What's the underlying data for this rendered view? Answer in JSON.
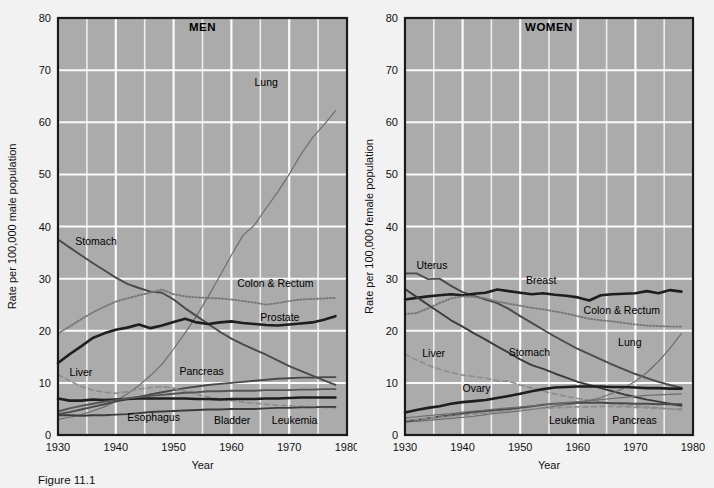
{
  "figure": {
    "background_color": "#f2f2f2",
    "plot_background_color": "#ababab",
    "gridline_color": "#ffffff",
    "frame_color": "#1a1a1a",
    "caption": "Figure 11.1"
  },
  "panels": [
    {
      "key": "men",
      "title": "MEN",
      "xlabel": "Year",
      "ylabel": "Rate per 100,000 male population"
    },
    {
      "key": "women",
      "title": "WOMEN",
      "xlabel": "Year",
      "ylabel": "Rate per 100,000 female population"
    }
  ],
  "chart_data": [
    {
      "type": "line",
      "title": "MEN",
      "xlabel": "Year",
      "ylabel": "Rate per 100,000 male population",
      "xlim": [
        1930,
        1980
      ],
      "ylim": [
        0,
        80
      ],
      "xticks": [
        1930,
        1940,
        1950,
        1960,
        1970,
        1980
      ],
      "yticks": [
        0,
        10,
        20,
        30,
        40,
        50,
        60,
        70,
        80
      ],
      "grid": true,
      "minor_grid_x_every": 5,
      "legend": "inline-annotations",
      "x": [
        1930,
        1932,
        1934,
        1936,
        1938,
        1940,
        1942,
        1944,
        1946,
        1948,
        1950,
        1952,
        1954,
        1956,
        1958,
        1960,
        1962,
        1964,
        1966,
        1968,
        1970,
        1972,
        1974,
        1976,
        1978
      ],
      "series": [
        {
          "name": "Lung",
          "style": "thin-solid",
          "color": "#6e6e6e",
          "values": [
            3.0,
            3.4,
            3.9,
            4.6,
            5.4,
            6.5,
            7.9,
            9.5,
            11.4,
            13.6,
            16.5,
            19.6,
            22.9,
            26.6,
            30.5,
            34.5,
            38.3,
            40.3,
            43.5,
            46.6,
            50.0,
            53.8,
            57.0,
            59.5,
            62.2
          ]
        },
        {
          "name": "Stomach",
          "style": "medium-solid",
          "color": "#4a4a4a",
          "values": [
            37.5,
            36.0,
            34.5,
            33.0,
            31.6,
            30.2,
            29.0,
            28.2,
            27.5,
            27.3,
            26.0,
            24.3,
            22.8,
            21.3,
            19.8,
            18.5,
            17.4,
            16.4,
            15.4,
            14.3,
            13.2,
            12.3,
            11.4,
            10.5,
            9.6
          ]
        },
        {
          "name": "Colon & Rectum",
          "style": "dotted",
          "color": "#777777",
          "values": [
            19.5,
            20.8,
            22.2,
            23.5,
            24.6,
            25.6,
            26.2,
            26.8,
            27.3,
            27.9,
            27.0,
            26.6,
            26.4,
            26.3,
            26.2,
            26.0,
            25.7,
            25.4,
            25.0,
            25.3,
            25.7,
            26.0,
            26.1,
            26.2,
            26.3
          ]
        },
        {
          "name": "Prostate",
          "style": "thick-solid",
          "color": "#1e1e1e",
          "values": [
            13.8,
            15.5,
            17.0,
            18.6,
            19.5,
            20.2,
            20.6,
            21.2,
            20.5,
            21.0,
            21.7,
            22.3,
            21.6,
            21.3,
            21.6,
            21.8,
            21.5,
            21.3,
            21.1,
            21.0,
            21.2,
            21.4,
            21.6,
            22.1,
            22.8
          ]
        },
        {
          "name": "Pancreas",
          "style": "medium-solid",
          "color": "#4a4a4a",
          "values": [
            4.0,
            4.4,
            4.9,
            5.4,
            5.9,
            6.4,
            6.9,
            7.3,
            7.8,
            8.2,
            8.6,
            9.0,
            9.3,
            9.6,
            9.8,
            10.0,
            10.2,
            10.4,
            10.6,
            10.8,
            10.9,
            11.0,
            11.0,
            11.1,
            11.1
          ]
        },
        {
          "name": "Liver",
          "style": "dashed",
          "color": "#8e8e8e",
          "values": [
            11.6,
            10.4,
            9.3,
            8.6,
            8.2,
            8.0,
            8.3,
            8.8,
            9.1,
            9.3,
            9.0,
            8.4,
            7.8,
            7.3,
            6.9,
            6.6,
            6.3,
            6.1,
            5.9,
            5.7,
            5.6,
            5.5,
            5.4,
            5.3,
            5.2
          ]
        },
        {
          "name": "Esophagus",
          "style": "medium-solid",
          "color": "#3c3c3c",
          "values": [
            3.8,
            3.8,
            3.7,
            3.8,
            3.8,
            3.9,
            4.0,
            4.2,
            4.4,
            4.5,
            4.6,
            4.7,
            4.8,
            4.9,
            4.9,
            5.0,
            5.0,
            5.0,
            5.1,
            5.2,
            5.2,
            5.3,
            5.3,
            5.4,
            5.4
          ]
        },
        {
          "name": "Bladder",
          "style": "thick-solid",
          "color": "#1e1e1e",
          "values": [
            7.0,
            6.6,
            6.6,
            6.8,
            6.7,
            6.8,
            6.9,
            7.0,
            7.0,
            7.0,
            7.0,
            7.0,
            6.9,
            6.9,
            6.8,
            6.9,
            6.9,
            6.9,
            7.0,
            7.0,
            7.1,
            7.2,
            7.2,
            7.2,
            7.2
          ]
        },
        {
          "name": "Leukemia",
          "style": "medium-solid",
          "color": "#555555",
          "values": [
            4.5,
            5.1,
            5.6,
            6.0,
            6.4,
            6.7,
            7.0,
            7.3,
            7.5,
            7.7,
            7.9,
            8.1,
            8.2,
            8.4,
            8.4,
            8.5,
            8.5,
            8.5,
            8.6,
            8.6,
            8.6,
            8.7,
            8.7,
            8.8,
            8.8
          ]
        }
      ],
      "annotations": [
        {
          "text": "Lung",
          "x": 1964,
          "y": 67
        },
        {
          "text": "Stomach",
          "x": 1933,
          "y": 36.5
        },
        {
          "text": "Colon & Rectum",
          "x": 1961,
          "y": 28.3
        },
        {
          "text": "Prostate",
          "x": 1965,
          "y": 21.8
        },
        {
          "text": "Pancreas",
          "x": 1951,
          "y": 11.6
        },
        {
          "text": "Liver",
          "x": 1932,
          "y": 11.3
        },
        {
          "text": "Esophagus",
          "x": 1942,
          "y": 2.6
        },
        {
          "text": "Bladder",
          "x": 1957,
          "y": 2.2
        },
        {
          "text": "Leukemia",
          "x": 1967,
          "y": 2.2
        }
      ]
    },
    {
      "type": "line",
      "title": "WOMEN",
      "xlabel": "Year",
      "ylabel": "Rate per 100,000 female population",
      "xlim": [
        1930,
        1980
      ],
      "ylim": [
        0,
        80
      ],
      "xticks": [
        1930,
        1940,
        1950,
        1960,
        1970,
        1980
      ],
      "yticks": [
        0,
        10,
        20,
        30,
        40,
        50,
        60,
        70,
        80
      ],
      "grid": true,
      "minor_grid_x_every": 5,
      "legend": "inline-annotations",
      "x": [
        1930,
        1932,
        1934,
        1936,
        1938,
        1940,
        1942,
        1944,
        1946,
        1948,
        1950,
        1952,
        1954,
        1956,
        1958,
        1960,
        1962,
        1964,
        1966,
        1968,
        1970,
        1972,
        1974,
        1976,
        1978
      ],
      "series": [
        {
          "name": "Uterus",
          "style": "medium-solid",
          "color": "#4a4a4a",
          "values": [
            31.0,
            31.0,
            29.9,
            30.0,
            28.6,
            27.4,
            26.7,
            26.0,
            25.3,
            24.2,
            22.8,
            21.5,
            20.2,
            18.9,
            17.7,
            16.5,
            15.5,
            14.5,
            13.5,
            12.6,
            11.7,
            10.9,
            10.2,
            9.6,
            9.1
          ]
        },
        {
          "name": "Breast",
          "style": "thick-solid",
          "color": "#1e1e1e",
          "values": [
            26.0,
            26.3,
            26.6,
            26.8,
            27.0,
            26.8,
            27.1,
            27.3,
            27.9,
            27.6,
            27.3,
            27.0,
            27.2,
            26.9,
            26.7,
            26.4,
            25.8,
            26.8,
            27.0,
            27.1,
            27.2,
            27.6,
            27.2,
            27.8,
            27.5
          ]
        },
        {
          "name": "Colon & Rectum",
          "style": "dotted",
          "color": "#777777",
          "values": [
            23.2,
            23.4,
            24.3,
            25.3,
            26.2,
            26.6,
            26.5,
            26.2,
            25.6,
            25.2,
            24.8,
            24.4,
            24.1,
            23.7,
            23.3,
            22.8,
            22.3,
            22.0,
            21.8,
            21.5,
            21.2,
            21.0,
            20.9,
            20.8,
            20.8
          ]
        },
        {
          "name": "Stomach",
          "style": "medium-solid",
          "color": "#3c3c3c",
          "values": [
            28.0,
            26.5,
            25.0,
            23.5,
            22.0,
            20.8,
            19.5,
            18.3,
            17.0,
            15.8,
            14.5,
            13.4,
            12.7,
            11.8,
            11.0,
            10.2,
            9.6,
            9.0,
            8.4,
            7.8,
            7.3,
            6.8,
            6.4,
            6.0,
            5.6
          ]
        },
        {
          "name": "Lung",
          "style": "thin-solid",
          "color": "#6e6e6e",
          "values": [
            2.5,
            2.6,
            2.8,
            3.0,
            3.2,
            3.4,
            3.6,
            3.9,
            4.2,
            4.4,
            4.6,
            4.9,
            5.2,
            5.5,
            5.8,
            6.1,
            6.6,
            7.2,
            8.0,
            9.0,
            10.3,
            12.0,
            14.1,
            16.6,
            19.5
          ]
        },
        {
          "name": "Liver",
          "style": "dashed",
          "color": "#8e8e8e",
          "values": [
            15.5,
            14.4,
            13.4,
            12.6,
            12.0,
            11.5,
            11.2,
            10.9,
            10.4,
            10.3,
            9.6,
            9.0,
            8.4,
            7.9,
            7.4,
            7.0,
            6.7,
            6.4,
            6.1,
            5.8,
            5.6,
            5.4,
            5.2,
            5.0,
            4.8
          ]
        },
        {
          "name": "Ovary",
          "style": "thick-solid",
          "color": "#1e1e1e",
          "values": [
            4.3,
            4.8,
            5.2,
            5.5,
            6.0,
            6.3,
            6.5,
            6.7,
            7.1,
            7.5,
            7.9,
            8.4,
            8.8,
            9.1,
            9.2,
            9.3,
            9.3,
            9.3,
            9.2,
            9.2,
            9.1,
            9.0,
            9.0,
            8.9,
            8.9
          ]
        },
        {
          "name": "Leukemia",
          "style": "medium-solid",
          "color": "#4a4a4a",
          "values": [
            2.6,
            2.9,
            3.2,
            3.5,
            3.8,
            4.1,
            4.4,
            4.6,
            4.8,
            5.0,
            5.2,
            5.5,
            5.8,
            6.0,
            6.1,
            6.2,
            6.2,
            6.2,
            6.1,
            6.1,
            6.0,
            6.0,
            5.9,
            5.9,
            5.9
          ]
        },
        {
          "name": "Pancreas",
          "style": "thin-solid",
          "color": "#6e6e6e",
          "values": [
            3.3,
            3.5,
            3.7,
            3.9,
            4.1,
            4.4,
            4.6,
            4.8,
            5.0,
            5.2,
            5.4,
            5.6,
            5.8,
            6.0,
            6.2,
            6.4,
            6.6,
            6.8,
            7.0,
            7.2,
            7.4,
            7.6,
            7.7,
            7.8,
            7.9
          ]
        },
        {
          "name": "Pancreas-dashed",
          "style": "dashed",
          "color": "#8e8e8e",
          "values": [
            2.8,
            3.0,
            3.2,
            3.4,
            3.6,
            3.8,
            4.0,
            4.2,
            4.4,
            4.6,
            4.8,
            5.0,
            5.1,
            5.2,
            5.3,
            5.4,
            5.4,
            5.5,
            5.5,
            5.4,
            5.3,
            5.2,
            5.1,
            5.0,
            5.0
          ]
        }
      ],
      "annotations": [
        {
          "text": "Uterus",
          "x": 1932,
          "y": 31.8
        },
        {
          "text": "Breast",
          "x": 1951,
          "y": 29.0
        },
        {
          "text": "Colon & Rectum",
          "x": 1961,
          "y": 23.3
        },
        {
          "text": "Stomach",
          "x": 1948,
          "y": 15.2
        },
        {
          "text": "Lung",
          "x": 1967,
          "y": 17.0
        },
        {
          "text": "Liver",
          "x": 1933,
          "y": 15.0
        },
        {
          "text": "Ovary",
          "x": 1940,
          "y": 8.2
        },
        {
          "text": "Leukemia",
          "x": 1955,
          "y": 2.2
        },
        {
          "text": "Pancreas",
          "x": 1966,
          "y": 2.2
        }
      ]
    }
  ]
}
